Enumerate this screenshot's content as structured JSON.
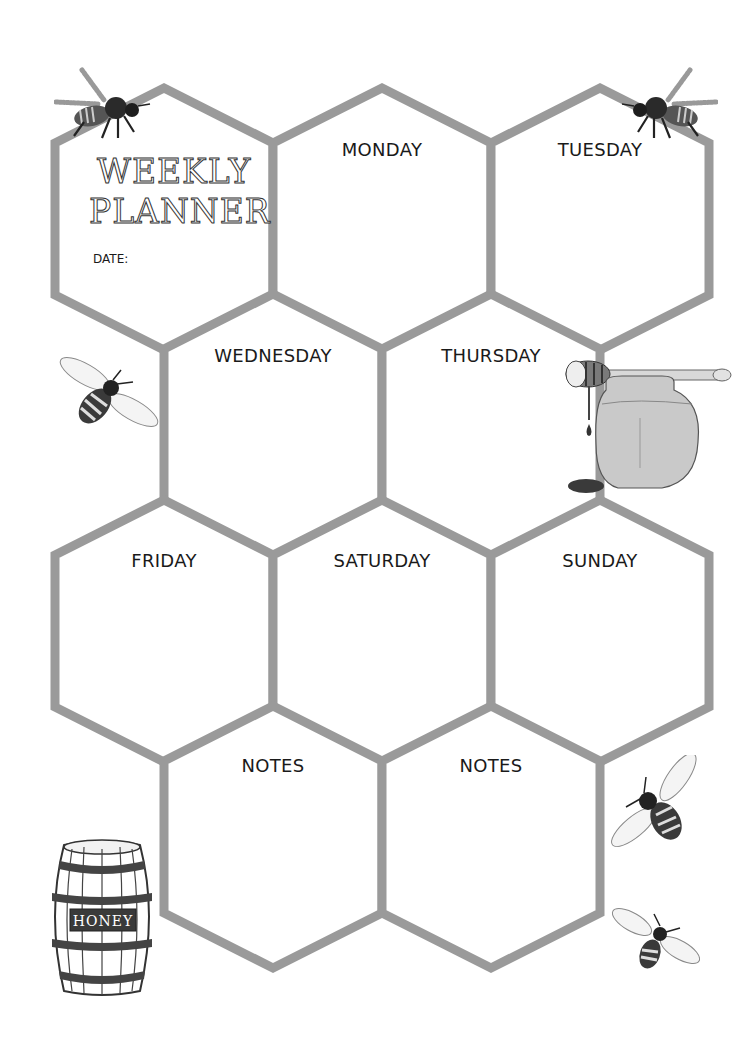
{
  "planner": {
    "title_line1": "WEEKLY",
    "title_line2": "PLANNER",
    "date_label": "DATE:",
    "date_value": ""
  },
  "cells": [
    {
      "id": "title",
      "label": ""
    },
    {
      "id": "monday",
      "label": "MONDAY"
    },
    {
      "id": "tuesday",
      "label": "TUESDAY"
    },
    {
      "id": "wednesday",
      "label": "WEDNESDAY"
    },
    {
      "id": "thursday",
      "label": "THURSDAY"
    },
    {
      "id": "friday",
      "label": "FRIDAY"
    },
    {
      "id": "saturday",
      "label": "SATURDAY"
    },
    {
      "id": "sunday",
      "label": "SUNDAY"
    },
    {
      "id": "notes-1",
      "label": "NOTES"
    },
    {
      "id": "notes-2",
      "label": "NOTES"
    }
  ],
  "decorations": {
    "barrel_label": "HONEY",
    "icons": [
      "bee-icon",
      "honey-dipper-icon",
      "honey-jar-icon",
      "honey-barrel-icon"
    ]
  },
  "colors": {
    "hex_border": "#9a9a9a",
    "background": "#ffffff",
    "text": "#1a1a1a"
  }
}
